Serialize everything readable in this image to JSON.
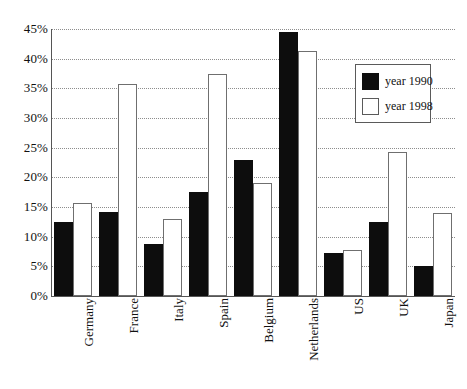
{
  "chart_data": {
    "type": "bar",
    "title": "",
    "subtitle": "",
    "xlabel": "",
    "ylabel": "",
    "categories": [
      "Germany",
      "France",
      "Italy",
      "Spain",
      "Belgium",
      "Netherlands",
      "US",
      "UK",
      "Japan"
    ],
    "series": [
      {
        "name": "year 1990",
        "color": "#0d0d0d",
        "values": [
          12.5,
          14.2,
          8.7,
          17.5,
          23.0,
          44.5,
          7.3,
          12.4,
          5.0
        ]
      },
      {
        "name": "year 1998",
        "color": "#ffffff",
        "values": [
          15.7,
          35.8,
          13.0,
          37.5,
          19.0,
          41.3,
          7.8,
          24.2,
          14.0
        ]
      }
    ],
    "ylim": [
      0,
      45
    ],
    "ytick_values": [
      0,
      5,
      10,
      15,
      20,
      25,
      30,
      35,
      40,
      45
    ],
    "ytick_labels": [
      "0%",
      "5%",
      "10%",
      "15%",
      "20%",
      "25%",
      "30%",
      "35%",
      "40%",
      "45%"
    ],
    "grid": true,
    "grid_axis": "y",
    "grid_style": "dotted",
    "legend_position": "top-right",
    "xtick_rotation": -90,
    "units": "percent"
  },
  "legend": {
    "items": [
      {
        "label": "year 1990"
      },
      {
        "label": "year 1998"
      }
    ]
  }
}
